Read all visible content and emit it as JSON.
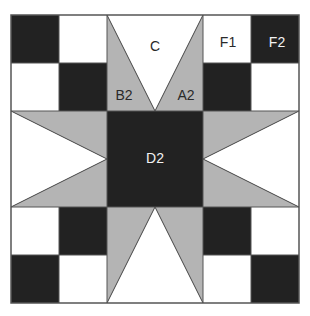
{
  "diagram": {
    "type": "quilt-block",
    "grid_units": 6,
    "colors": {
      "dark": "#222222",
      "gray": "#b4b4b4",
      "light": "#ffffff",
      "outline": "#555555"
    },
    "labels": {
      "C": "C",
      "F1": "F1",
      "F2": "F2",
      "B2": "B2",
      "A2": "A2",
      "D2": "D2"
    }
  }
}
